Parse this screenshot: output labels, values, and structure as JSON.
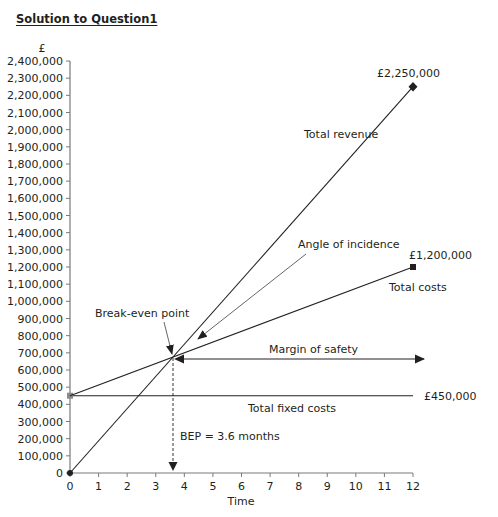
{
  "title": "Solution to Question1",
  "chart_data": {
    "type": "line",
    "title": "Solution to Question1",
    "xlabel": "Time",
    "ylabel": "£",
    "xlim": [
      0,
      12
    ],
    "ylim": [
      0,
      2400000
    ],
    "x_ticks": [
      "0",
      "1",
      "2",
      "3",
      "4",
      "5",
      "6",
      "7",
      "8",
      "9",
      "10",
      "11",
      "12"
    ],
    "y_ticks": [
      "0",
      "100,000",
      "200,000",
      "300,000",
      "400,000",
      "500,000",
      "600,000",
      "700,000",
      "800,000",
      "900,000",
      "1,000,000",
      "1,100,000",
      "1,200,000",
      "1,300,000",
      "1,400,000",
      "1,500,000",
      "1,600,000",
      "1,700,000",
      "1,800,000",
      "1,900,000",
      "2,000,000",
      "2,100,000",
      "2,200,000",
      "2,300,000",
      "2,400,000"
    ],
    "grid": false,
    "series": [
      {
        "name": "Total revenue",
        "x": [
          0,
          12
        ],
        "y": [
          0,
          2250000
        ],
        "end_label": "£2,250,000",
        "marker": "diamond"
      },
      {
        "name": "Total costs",
        "x": [
          0,
          12
        ],
        "y": [
          450000,
          1200000
        ],
        "end_label": "£1,200,000",
        "marker": "square"
      },
      {
        "name": "Total fixed costs",
        "x": [
          0,
          12
        ],
        "y": [
          450000,
          450000
        ],
        "end_label": "£450,000"
      }
    ],
    "annotations": [
      {
        "text": "Break-even point",
        "x": 3.6,
        "y": 675000
      },
      {
        "text": "Angle of incidence"
      },
      {
        "text": "Margin of safety",
        "from_x": 3.6,
        "to_x": 12,
        "y": 675000
      },
      {
        "text": "BEP = 3.6 months",
        "x": 3.6
      }
    ]
  },
  "labels": {
    "currency": "£",
    "x_axis": "Time",
    "revenue_value": "£2,250,000",
    "revenue_name": "Total revenue",
    "costs_value": "£1,200,000",
    "costs_name": "Total costs",
    "fixed_value": "£450,000",
    "fixed_name": "Total fixed costs",
    "angle": "Angle of incidence",
    "bep_point": "Break-even point",
    "margin": "Margin of safety",
    "bep_months": "BEP = 3.6 months"
  }
}
